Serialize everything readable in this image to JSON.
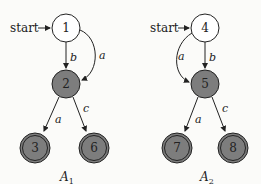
{
  "automata": [
    {
      "name": "A1",
      "caption": "A",
      "caption_sub": "1",
      "start_label": "start",
      "nodes": [
        {
          "id": "1",
          "label": "1",
          "accepting": false
        },
        {
          "id": "2",
          "label": "2",
          "accepting": false,
          "shaded": true
        },
        {
          "id": "3",
          "label": "3",
          "accepting": true
        },
        {
          "id": "6",
          "label": "6",
          "accepting": true
        }
      ],
      "edges": [
        {
          "from": "1",
          "to": "2",
          "label": "b"
        },
        {
          "from": "1",
          "to": "2",
          "label": "a",
          "curved": true
        },
        {
          "from": "2",
          "to": "3",
          "label": "a"
        },
        {
          "from": "2",
          "to": "6",
          "label": "c"
        }
      ]
    },
    {
      "name": "A2",
      "caption": "A",
      "caption_sub": "2",
      "start_label": "start",
      "nodes": [
        {
          "id": "4",
          "label": "4",
          "accepting": false
        },
        {
          "id": "5",
          "label": "5",
          "accepting": false,
          "shaded": true
        },
        {
          "id": "7",
          "label": "7",
          "accepting": true
        },
        {
          "id": "8",
          "label": "8",
          "accepting": true
        }
      ],
      "edges": [
        {
          "from": "4",
          "to": "5",
          "label": "b"
        },
        {
          "from": "4",
          "to": "5",
          "label": "a",
          "curved": true
        },
        {
          "from": "5",
          "to": "7",
          "label": "a"
        },
        {
          "from": "5",
          "to": "8",
          "label": "c"
        }
      ]
    }
  ],
  "colors": {
    "shaded": "#7d7d7d",
    "stroke": "#222222",
    "background": "#fbfbf9"
  }
}
